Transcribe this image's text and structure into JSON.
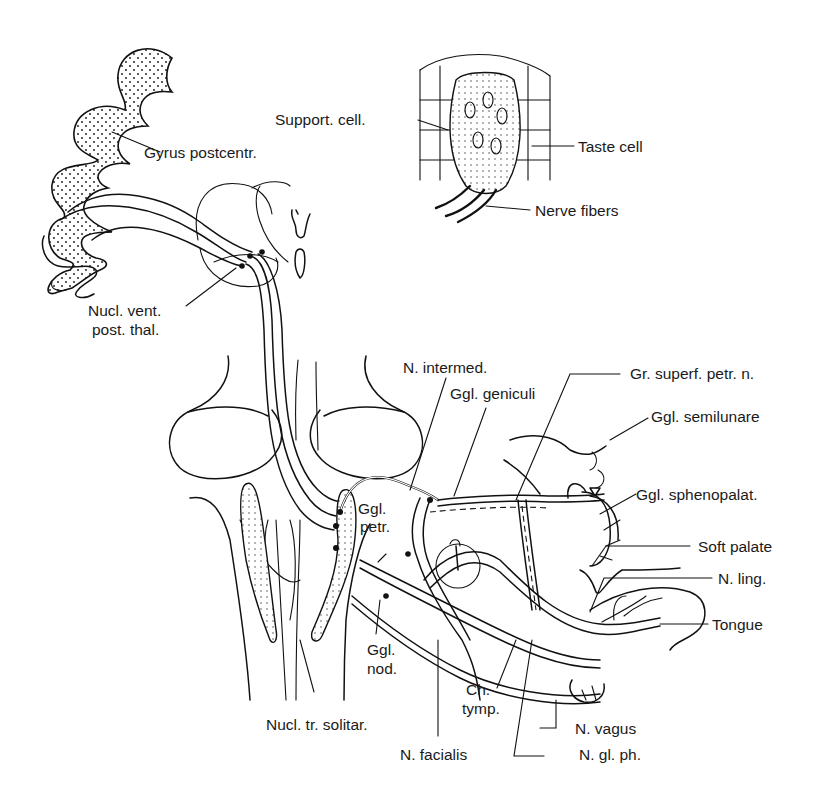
{
  "figure": {
    "background_color": "#ffffff",
    "ink_color": "#111111"
  },
  "labels": {
    "gyrus_postcentr": "Gyrus postcentr.",
    "nucl_vent_line1": "Nucl. vent.",
    "nucl_vent_line2": "post. thal.",
    "support_cell": "Support. cell.",
    "taste_cell": "Taste cell",
    "nerve_fibers": "Nerve fibers",
    "n_intermed": "N. intermed.",
    "ggl_geniculi": "Ggl. geniculi",
    "gr_superf_petr": "Gr. superf. petr. n.",
    "ggl_semilunare": "Ggl. semilunare",
    "ggl_sphenopalat": "Ggl. sphenopalat.",
    "ggl_petr_line1": "Ggl.",
    "ggl_petr_line2": "petr.",
    "soft_palate": "Soft palate",
    "n_ling": "N. ling.",
    "tongue": "Tongue",
    "ggl_nod_line1": "Ggl.",
    "ggl_nod_line2": "nod.",
    "ch_tymp_line1": "Ch.",
    "ch_tymp_line2": "tymp.",
    "nucl_tr_solitar": "Nucl. tr. solitar.",
    "n_facialis": "N. facialis",
    "n_vagus": "N. vagus",
    "n_gl_ph": "N. gl. ph."
  }
}
